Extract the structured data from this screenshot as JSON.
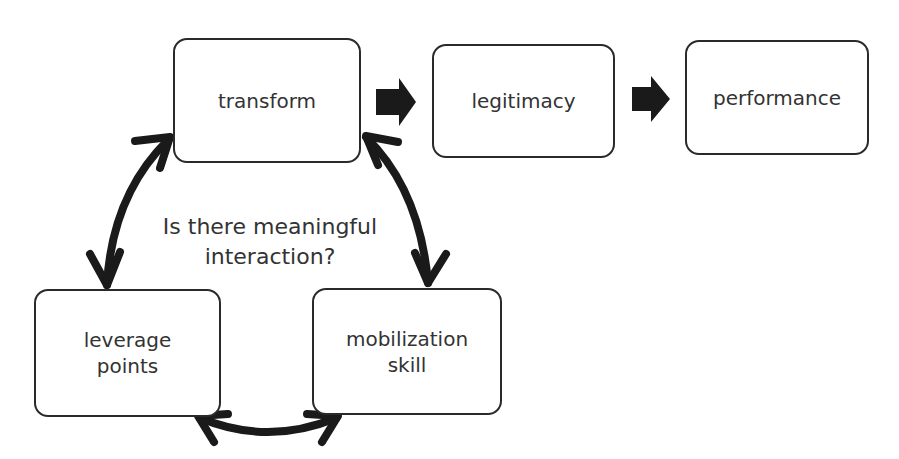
{
  "diagram": {
    "nodes": [
      {
        "id": "transform",
        "label": "transform"
      },
      {
        "id": "legitimacy",
        "label": "legitimacy"
      },
      {
        "id": "performance",
        "label": "performance"
      },
      {
        "id": "leverage_points",
        "label_line1": "leverage",
        "label_line2": "points"
      },
      {
        "id": "mobilization_skill",
        "label_line1": "mobilization",
        "label_line2": "skill"
      }
    ],
    "caption": {
      "line1": "Is there meaningful",
      "line2": "interaction?"
    },
    "edges": [
      {
        "from": "transform",
        "to": "legitimacy",
        "type": "block-arrow"
      },
      {
        "from": "legitimacy",
        "to": "performance",
        "type": "block-arrow"
      },
      {
        "from": "transform",
        "to": "leverage_points",
        "type": "double-curved-arrow"
      },
      {
        "from": "transform",
        "to": "mobilization_skill",
        "type": "double-curved-arrow"
      },
      {
        "from": "leverage_points",
        "to": "mobilization_skill",
        "type": "double-curved-arrow"
      }
    ],
    "colors": {
      "stroke": "#2a2a2a",
      "text": "#333333",
      "background": "#ffffff"
    }
  }
}
